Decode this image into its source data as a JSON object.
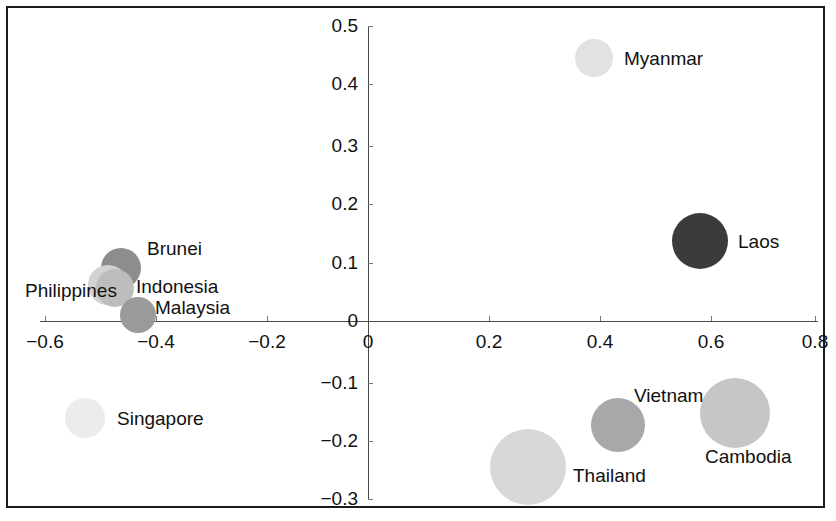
{
  "chart_data": {
    "type": "scatter",
    "title": "",
    "subtitle": "",
    "xlabel": "",
    "ylabel": "",
    "xlim": [
      -0.6,
      0.8
    ],
    "ylim": [
      -0.3,
      0.5
    ],
    "grid": false,
    "legend": "none",
    "note": "Bubble (scatter) plot of ASEAN countries; bubble area encodes a third magnitude, bubble fill shade varies per country.",
    "x_ticks": [
      {
        "value": -0.6,
        "label": "−0.6",
        "px": 45
      },
      {
        "value": -0.4,
        "label": "−0.4",
        "px": 156
      },
      {
        "value": -0.2,
        "label": "−0.2",
        "px": 267
      },
      {
        "value": 0,
        "label": "0",
        "px": 368
      },
      {
        "value": 0.2,
        "label": "0.2",
        "px": 489
      },
      {
        "value": 0.4,
        "label": "0.4",
        "px": 600
      },
      {
        "value": 0.6,
        "label": "0.6",
        "px": 711
      },
      {
        "value": 0.8,
        "label": "0.8",
        "px": 815
      }
    ],
    "y_ticks": [
      {
        "value": 0.5,
        "label": "0.5",
        "px": 26
      },
      {
        "value": 0.4,
        "label": "0.4",
        "px": 84
      },
      {
        "value": 0.3,
        "label": "0.3",
        "px": 146
      },
      {
        "value": 0.2,
        "label": "0.2",
        "px": 204
      },
      {
        "value": 0.1,
        "label": "0.1",
        "px": 263
      },
      {
        "value": 0,
        "label": "0",
        "px": 321
      },
      {
        "value": -0.1,
        "label": "−0.1",
        "px": 383
      },
      {
        "value": -0.2,
        "label": "−0.2",
        "px": 441
      },
      {
        "value": -0.3,
        "label": "−0.3",
        "px": 499
      }
    ],
    "points": [
      {
        "label": "Myanmar",
        "x": 0.41,
        "y": 0.45,
        "px": 594,
        "py": 58,
        "r": 19,
        "color": "#e2e2e2",
        "label_px": 624,
        "label_py": 48,
        "label_align": "left"
      },
      {
        "label": "Laos",
        "x": 0.6,
        "y": 0.14,
        "px": 700,
        "py": 241,
        "r": 28,
        "color": "#3b3b3b",
        "label_px": 738,
        "label_py": 231,
        "label_align": "left"
      },
      {
        "label": "Brunei",
        "x": -0.44,
        "y": 0.09,
        "px": 121,
        "py": 268,
        "r": 20,
        "color": "#8d8d8d",
        "label_px": 147,
        "label_py": 238,
        "label_align": "left"
      },
      {
        "label": "Philippines",
        "x": -0.47,
        "y": 0.06,
        "px": 108,
        "py": 285,
        "r": 20,
        "color": "#d2d2d2",
        "label_px": 25,
        "label_py": 280,
        "label_align": "left"
      },
      {
        "label": "Indonesia",
        "x": -0.45,
        "y": 0.05,
        "px": 115,
        "py": 288,
        "r": 19,
        "color": "#bdbdbd",
        "label_px": 136,
        "label_py": 276,
        "label_align": "left"
      },
      {
        "label": "Malaysia",
        "x": -0.41,
        "y": 0.01,
        "px": 138,
        "py": 315,
        "r": 18,
        "color": "#9a9a9a",
        "label_px": 155,
        "label_py": 297,
        "label_align": "left"
      },
      {
        "label": "Singapore",
        "x": -0.51,
        "y": -0.17,
        "px": 85,
        "py": 418,
        "r": 20,
        "color": "#ececec",
        "label_px": 117,
        "label_py": 408,
        "label_align": "left"
      },
      {
        "label": "Thailand",
        "x": 0.29,
        "y": -0.25,
        "px": 528,
        "py": 467,
        "r": 38,
        "color": "#d8d8d8",
        "label_px": 573,
        "label_py": 465,
        "label_align": "left"
      },
      {
        "label": "Vietnam",
        "x": 0.45,
        "y": -0.18,
        "px": 618,
        "py": 425,
        "r": 27,
        "color": "#a8a8a8",
        "label_px": 634,
        "label_py": 385,
        "label_align": "left"
      },
      {
        "label": "Cambodia",
        "x": 0.66,
        "y": -0.16,
        "px": 735,
        "py": 413,
        "r": 35,
        "color": "#c6c6c6",
        "label_px": 705,
        "label_py": 446,
        "label_align": "left"
      }
    ]
  },
  "axes": {
    "x_axis_origin_px": 368,
    "x_axis_y_px": 321,
    "x_axis_start_px": 40,
    "x_axis_end_px": 818,
    "y_axis_x_px": 368,
    "y_axis_top_px": 26,
    "y_axis_bottom_px": 500
  }
}
